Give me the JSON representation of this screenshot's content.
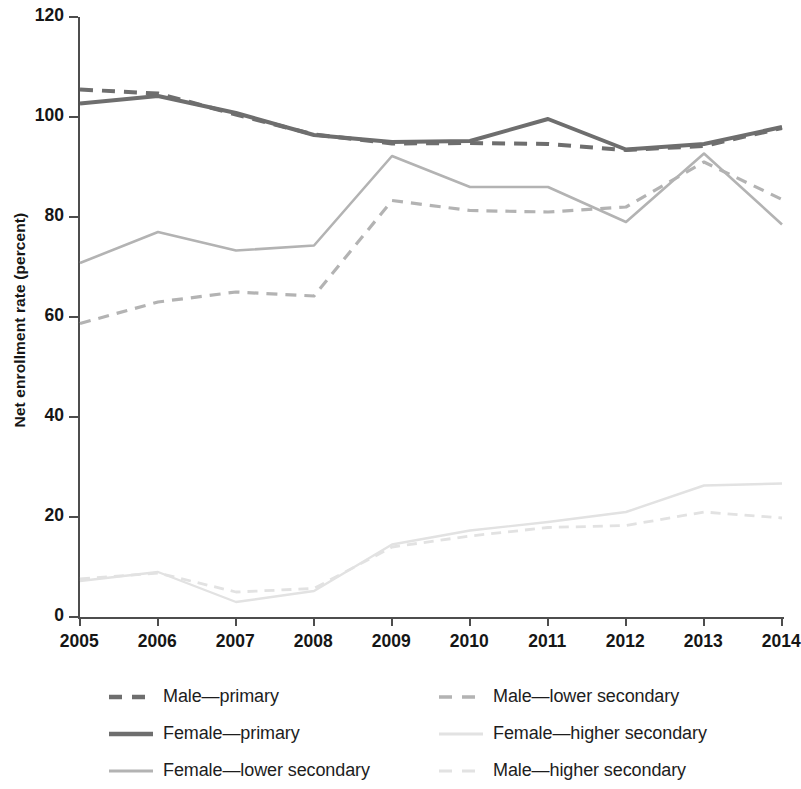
{
  "chart_data": {
    "type": "line",
    "title": "",
    "xlabel": "",
    "ylabel": "Net enrollment rate (percent)",
    "x": [
      2005,
      2006,
      2007,
      2008,
      2009,
      2010,
      2011,
      2012,
      2013,
      2014
    ],
    "xtick_labels": [
      "2005",
      "2006",
      "2007",
      "2008",
      "2009",
      "2010",
      "2011",
      "2012",
      "2013",
      "2014"
    ],
    "ytick_labels": [
      "0",
      "20",
      "40",
      "60",
      "80",
      "100",
      "120"
    ],
    "yticks": [
      0,
      20,
      40,
      60,
      80,
      100,
      120
    ],
    "ylim": [
      0,
      120
    ],
    "xlim": [
      2005,
      2014
    ],
    "grid": false,
    "legend_position": "below",
    "series": [
      {
        "name": "Male—primary",
        "key": "male-primary",
        "style": "dashed",
        "color": "#6e6e6e",
        "width": 4.0,
        "dash": "13,9",
        "values": [
          105.5,
          104.7,
          100.5,
          96.5,
          94.7,
          94.8,
          94.6,
          93.4,
          94.2,
          97.8
        ]
      },
      {
        "name": "Female—primary",
        "key": "female-primary",
        "style": "solid",
        "color": "#6e6e6e",
        "width": 4.0,
        "dash": "",
        "values": [
          102.7,
          104.2,
          100.8,
          96.4,
          95.0,
          95.2,
          99.6,
          93.5,
          94.6,
          98.0
        ]
      },
      {
        "name": "Female—lower secondary",
        "key": "female-lower-secondary",
        "style": "solid",
        "color": "#b3b3b3",
        "width": 2.6,
        "dash": "",
        "values": [
          70.8,
          77.0,
          73.3,
          74.3,
          92.2,
          86.0,
          86.0,
          79.0,
          92.7,
          78.5
        ]
      },
      {
        "name": "Male—lower secondary",
        "key": "male-lower-secondary",
        "style": "dashed",
        "color": "#b3b3b3",
        "width": 3.2,
        "dash": "11,8",
        "values": [
          58.7,
          63.0,
          65.0,
          64.2,
          83.3,
          81.3,
          81.0,
          82.0,
          91.0,
          83.5
        ]
      },
      {
        "name": "Female—higher secondary",
        "key": "female-higher-secondary",
        "style": "solid",
        "color": "#e2e2e2",
        "width": 2.4,
        "dash": "",
        "values": [
          7.2,
          9.0,
          3.0,
          5.2,
          14.5,
          17.3,
          19.0,
          21.0,
          26.3,
          26.7
        ]
      },
      {
        "name": "Male—higher secondary",
        "key": "male-higher-secondary",
        "style": "dashed",
        "color": "#e2e2e2",
        "width": 2.8,
        "dash": "10,7",
        "values": [
          7.6,
          8.8,
          5.0,
          5.7,
          14.0,
          16.2,
          17.9,
          18.3,
          21.0,
          19.8
        ]
      }
    ]
  },
  "legend": {
    "items": [
      {
        "label": "Male—primary",
        "key": "male-primary"
      },
      {
        "label": "Male—lower secondary",
        "key": "male-lower-secondary"
      },
      {
        "label": "Female—primary",
        "key": "female-primary"
      },
      {
        "label": "Female—higher secondary",
        "key": "female-higher-secondary"
      },
      {
        "label": "Female—lower secondary",
        "key": "female-lower-secondary"
      },
      {
        "label": "Male—higher secondary",
        "key": "male-higher-secondary"
      }
    ],
    "order": [
      "male-primary",
      "male-lower-secondary",
      "female-primary",
      "female-higher-secondary",
      "female-lower-secondary",
      "male-higher-secondary"
    ]
  }
}
